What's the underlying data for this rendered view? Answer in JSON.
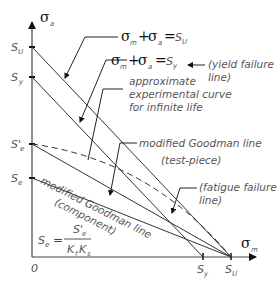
{
  "diagram": {
    "axes": {
      "y_symbol": "σ",
      "y_subscript": "a",
      "x_symbol": "σ",
      "x_subscript": "m",
      "origin": "0"
    },
    "y_ticks": [
      {
        "main": "S",
        "sub": "U"
      },
      {
        "main": "S",
        "sub": "y"
      },
      {
        "main": "S'",
        "sub": "e"
      },
      {
        "main": "S",
        "sub": "e"
      }
    ],
    "x_ticks": [
      {
        "main": "S",
        "sub": "y"
      },
      {
        "main": "S",
        "sub": "U"
      }
    ],
    "equations": {
      "ultimate": {
        "a": "σ",
        "a_sub": "m",
        "plus": "+",
        "b": "σ",
        "b_sub": "a",
        "eq": "=",
        "rhs": "S",
        "rhs_sub": "U"
      },
      "yield": {
        "a": "σ",
        "a_sub": "m",
        "plus": "+",
        "b": "σ",
        "b_sub": "a",
        "eq": "=",
        "rhs": "S",
        "rhs_sub": "y"
      }
    },
    "annotations": {
      "yield_failure_line_1": "(yield failure",
      "yield_failure_line_2": "line)",
      "curve_1": "approximate",
      "curve_2": "experimental curve",
      "curve_3": "for infinite life",
      "goodman_test_1": "modified Goodman line",
      "goodman_test_2": "(test-piece)",
      "fatigue_1": "(fatigue failure",
      "fatigue_2": "line)",
      "goodman_comp_1": "modified Goodman line",
      "goodman_comp_2": "(component)"
    },
    "formula": {
      "lhs": "S",
      "lhs_sub": "e",
      "eq": "=",
      "num": "S'",
      "num_sub": "e",
      "den_1": "K",
      "den_1_sub": "f",
      "den_2": "K",
      "den_2_sub": "s"
    },
    "colors": {
      "line": "#222222",
      "text": "#555555"
    }
  }
}
